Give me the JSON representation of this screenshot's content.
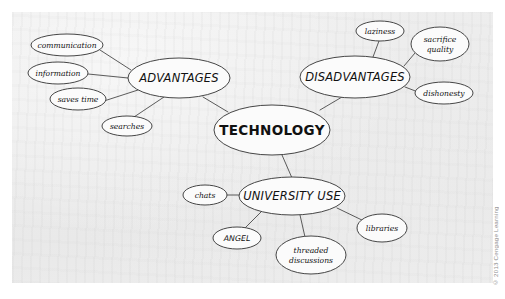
{
  "document": {
    "type": "concept-map",
    "title": "Technology concept map",
    "credit": "© 2013 Cengage Learning",
    "background_color": "#ececec",
    "ink_color": "#3c3c3c"
  },
  "map": {
    "center": {
      "id": "technology",
      "label": "TECHNOLOGY",
      "cx": 272,
      "cy": 130,
      "rx": 58,
      "ry": 25,
      "level": "center"
    },
    "branches": [
      {
        "id": "advantages",
        "label": "ADVANTAGES",
        "cx": 179,
        "cy": 78,
        "rx": 51,
        "ry": 20,
        "level": "main",
        "children": [
          {
            "id": "communication",
            "label": "communication",
            "cx": 67,
            "cy": 45,
            "rx": 36,
            "ry": 11,
            "level": "leaf"
          },
          {
            "id": "information",
            "label": "information",
            "cx": 58,
            "cy": 73,
            "rx": 30,
            "ry": 11,
            "level": "leaf"
          },
          {
            "id": "saves-time",
            "label": "saves time",
            "cx": 78,
            "cy": 99,
            "rx": 28,
            "ry": 11,
            "level": "leaf"
          },
          {
            "id": "searches",
            "label": "searches",
            "cx": 127,
            "cy": 126,
            "rx": 25,
            "ry": 10,
            "level": "leaf"
          }
        ]
      },
      {
        "id": "disadvantages",
        "label": "DISADVANTAGES",
        "cx": 355,
        "cy": 77,
        "rx": 55,
        "ry": 21,
        "level": "main",
        "children": [
          {
            "id": "laziness",
            "label": "laziness",
            "cx": 380,
            "cy": 31,
            "rx": 24,
            "ry": 10,
            "level": "leaf"
          },
          {
            "id": "sacrifice-quality",
            "label": "sacrifice\nquality",
            "cx": 440,
            "cy": 44,
            "rx": 29,
            "ry": 17,
            "level": "leaf"
          },
          {
            "id": "dishonesty",
            "label": "dishonesty",
            "cx": 444,
            "cy": 93,
            "rx": 29,
            "ry": 11,
            "level": "leaf"
          }
        ]
      },
      {
        "id": "university-use",
        "label": "UNIVERSITY USE",
        "cx": 292,
        "cy": 196,
        "rx": 53,
        "ry": 19,
        "level": "main",
        "children": [
          {
            "id": "chats",
            "label": "chats",
            "cx": 205,
            "cy": 195,
            "rx": 22,
            "ry": 10,
            "level": "leaf"
          },
          {
            "id": "angel",
            "label": "ANGEL",
            "cx": 237,
            "cy": 238,
            "rx": 24,
            "ry": 11,
            "level": "leaf-caps"
          },
          {
            "id": "threaded-discussions",
            "label": "threaded\ndiscussions",
            "cx": 311,
            "cy": 255,
            "rx": 35,
            "ry": 19,
            "level": "leaf"
          },
          {
            "id": "libraries",
            "label": "libraries",
            "cx": 382,
            "cy": 228,
            "rx": 25,
            "ry": 14,
            "level": "leaf"
          }
        ]
      }
    ],
    "edges": [
      {
        "from": "technology",
        "to": "advantages",
        "x1": 228,
        "y1": 112,
        "x2": 203,
        "y2": 97
      },
      {
        "from": "technology",
        "to": "disadvantages",
        "x1": 320,
        "y1": 110,
        "x2": 342,
        "y2": 97
      },
      {
        "from": "technology",
        "to": "university-use",
        "x1": 282,
        "y1": 155,
        "x2": 292,
        "y2": 178
      },
      {
        "from": "advantages",
        "to": "communication",
        "x1": 131,
        "y1": 70,
        "x2": 100,
        "y2": 50
      },
      {
        "from": "advantages",
        "to": "information",
        "x1": 128,
        "y1": 78,
        "x2": 88,
        "y2": 74
      },
      {
        "from": "advantages",
        "to": "saves-time",
        "x1": 138,
        "y1": 90,
        "x2": 104,
        "y2": 101
      },
      {
        "from": "advantages",
        "to": "searches",
        "x1": 164,
        "y1": 97,
        "x2": 134,
        "y2": 117
      },
      {
        "from": "disadvantages",
        "to": "laziness",
        "x1": 373,
        "y1": 57,
        "x2": 379,
        "y2": 41
      },
      {
        "from": "disadvantages",
        "to": "sacrifice-quality",
        "x1": 404,
        "y1": 66,
        "x2": 415,
        "y2": 53
      },
      {
        "from": "disadvantages",
        "to": "dishonesty",
        "x1": 405,
        "y1": 87,
        "x2": 418,
        "y2": 92
      },
      {
        "from": "university-use",
        "to": "chats",
        "x1": 239,
        "y1": 195,
        "x2": 227,
        "y2": 195
      },
      {
        "from": "university-use",
        "to": "angel",
        "x1": 262,
        "y1": 211,
        "x2": 245,
        "y2": 228
      },
      {
        "from": "university-use",
        "to": "threaded-discussions",
        "x1": 300,
        "y1": 215,
        "x2": 305,
        "y2": 237
      },
      {
        "from": "university-use",
        "to": "libraries",
        "x1": 337,
        "y1": 208,
        "x2": 366,
        "y2": 222
      }
    ]
  }
}
